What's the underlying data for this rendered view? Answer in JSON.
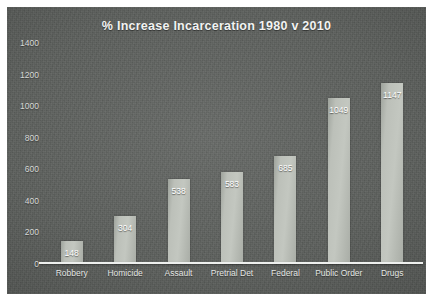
{
  "chart_data": {
    "type": "bar",
    "title": "% Increase Incarceration 1980 v 2010",
    "xlabel": "",
    "ylabel": "",
    "categories": [
      "Robbery",
      "Homicide",
      "Assault",
      "Pretrial Det",
      "Federal",
      "Public Order",
      "Drugs"
    ],
    "values": [
      148,
      304,
      538,
      583,
      685,
      1049,
      1147
    ],
    "value_labels": [
      "148",
      "304",
      "538",
      "583",
      "685",
      "1049",
      "1147"
    ],
    "ylim": [
      0,
      1400
    ],
    "ytick_labels": [
      "1400",
      "1200",
      "1000",
      "800",
      "600",
      "400",
      "200",
      "0"
    ],
    "yticks": [
      1400,
      1200,
      1000,
      800,
      600,
      400,
      200,
      0
    ],
    "grid": false,
    "legend": false,
    "legend_position": "none",
    "colors": {
      "panel_background": "#5c5f5c",
      "bar_fill": "#bcc0b9",
      "axis_line": "#eef0ee",
      "title_text": "#f2f3f2",
      "tick_text": "#d7d9d7",
      "value_label_text": "#ffffff",
      "page_background": "#ffffff"
    }
  }
}
